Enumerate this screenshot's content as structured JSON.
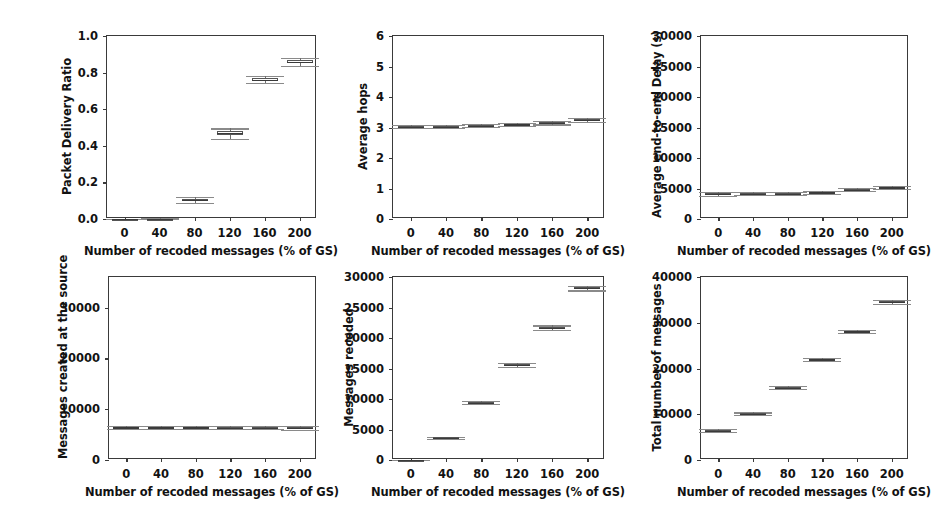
{
  "figure": {
    "background_color": "#ffffff",
    "axis_color": "#3a3a3a",
    "box_color": "#555555",
    "whisker_color": "#6e6e6e",
    "shared_xlabel": "Number of recoded messages (% of GS)",
    "shared_xticks": [
      "0",
      "40",
      "80",
      "120",
      "160",
      "200"
    ],
    "panel_count": 6
  },
  "chart_data": [
    {
      "id": "packet-delivery-ratio",
      "type": "box",
      "title": "",
      "xlabel": "Number of recoded messages (% of GS)",
      "ylabel": "Packet Delivery Ratio",
      "categories": [
        "0",
        "40",
        "80",
        "120",
        "160",
        "200"
      ],
      "x": [
        0,
        40,
        80,
        120,
        160,
        200
      ],
      "xlim": [
        -20,
        220
      ],
      "ylim": [
        0.0,
        1.0
      ],
      "yticks": [
        "0.0",
        "0.2",
        "0.4",
        "0.6",
        "0.8",
        "1.0"
      ],
      "ytick_values": [
        0.0,
        0.2,
        0.4,
        0.6,
        0.8,
        1.0
      ],
      "xticks": [
        "0",
        "40",
        "80",
        "120",
        "160",
        "200"
      ],
      "grid": false,
      "legend": "none",
      "boxes": [
        {
          "category": "0",
          "whisker_low": 0.0,
          "q1": 0.0,
          "median": 0.0,
          "q3": 0.0,
          "whisker_high": 0.0
        },
        {
          "category": "40",
          "whisker_low": 0.0,
          "q1": 0.0,
          "median": 0.0,
          "q3": 0.0,
          "whisker_high": 0.005
        },
        {
          "category": "80",
          "whisker_low": 0.088,
          "q1": 0.097,
          "median": 0.103,
          "q3": 0.11,
          "whisker_high": 0.118
        },
        {
          "category": "120",
          "whisker_low": 0.437,
          "q1": 0.461,
          "median": 0.472,
          "q3": 0.483,
          "whisker_high": 0.495
        },
        {
          "category": "160",
          "whisker_low": 0.742,
          "q1": 0.753,
          "median": 0.76,
          "q3": 0.77,
          "whisker_high": 0.782
        },
        {
          "category": "200",
          "whisker_low": 0.838,
          "q1": 0.852,
          "median": 0.86,
          "q3": 0.868,
          "whisker_high": 0.88
        }
      ]
    },
    {
      "id": "average-hops",
      "type": "box",
      "title": "",
      "xlabel": "Number of recoded messages (% of GS)",
      "ylabel": "Average hops",
      "categories": [
        "0",
        "40",
        "80",
        "120",
        "160",
        "200"
      ],
      "x": [
        0,
        40,
        80,
        120,
        160,
        200
      ],
      "xlim": [
        -20,
        220
      ],
      "ylim": [
        0,
        6
      ],
      "yticks": [
        "0",
        "1",
        "2",
        "3",
        "4",
        "5",
        "6"
      ],
      "ytick_values": [
        0,
        1,
        2,
        3,
        4,
        5,
        6
      ],
      "xticks": [
        "0",
        "40",
        "80",
        "120",
        "160",
        "200"
      ],
      "grid": false,
      "legend": "none",
      "boxes": [
        {
          "category": "0",
          "whisker_low": 2.98,
          "q1": 3.01,
          "median": 3.03,
          "q3": 3.05,
          "whisker_high": 3.08
        },
        {
          "category": "40",
          "whisker_low": 2.98,
          "q1": 3.01,
          "median": 3.03,
          "q3": 3.05,
          "whisker_high": 3.08
        },
        {
          "category": "80",
          "whisker_low": 3.01,
          "q1": 3.04,
          "median": 3.06,
          "q3": 3.08,
          "whisker_high": 3.11
        },
        {
          "category": "120",
          "whisker_low": 3.05,
          "q1": 3.08,
          "median": 3.1,
          "q3": 3.12,
          "whisker_high": 3.15
        },
        {
          "category": "160",
          "whisker_low": 3.1,
          "q1": 3.13,
          "median": 3.15,
          "q3": 3.17,
          "whisker_high": 3.2
        },
        {
          "category": "200",
          "whisker_low": 3.19,
          "q1": 3.22,
          "median": 3.25,
          "q3": 3.27,
          "whisker_high": 3.3
        }
      ]
    },
    {
      "id": "average-end-to-end-delay",
      "type": "box",
      "title": "",
      "xlabel": "Number of recoded messages (% of GS)",
      "ylabel": "Average end-to-end Delay (s)",
      "categories": [
        "0",
        "40",
        "80",
        "120",
        "160",
        "200"
      ],
      "x": [
        0,
        40,
        80,
        120,
        160,
        200
      ],
      "xlim": [
        -20,
        220
      ],
      "ylim": [
        0,
        30000
      ],
      "yticks": [
        "0",
        "5000",
        "10000",
        "15000",
        "20000",
        "25000",
        "30000"
      ],
      "ytick_values": [
        0,
        5000,
        10000,
        15000,
        20000,
        25000,
        30000
      ],
      "xticks": [
        "0",
        "40",
        "80",
        "120",
        "160",
        "200"
      ],
      "grid": false,
      "legend": "none",
      "boxes": [
        {
          "category": "0",
          "whisker_low": 3850,
          "q1": 4050,
          "median": 4150,
          "q3": 4250,
          "whisker_high": 4450
        },
        {
          "category": "40",
          "whisker_low": 3870,
          "q1": 4060,
          "median": 4160,
          "q3": 4260,
          "whisker_high": 4460
        },
        {
          "category": "80",
          "whisker_low": 3950,
          "q1": 4090,
          "median": 4180,
          "q3": 4270,
          "whisker_high": 4400
        },
        {
          "category": "120",
          "whisker_low": 4050,
          "q1": 4250,
          "median": 4350,
          "q3": 4450,
          "whisker_high": 4650
        },
        {
          "category": "160",
          "whisker_low": 4550,
          "q1": 4720,
          "median": 4820,
          "q3": 4920,
          "whisker_high": 5100
        },
        {
          "category": "200",
          "whisker_low": 4950,
          "q1": 5100,
          "median": 5200,
          "q3": 5300,
          "whisker_high": 5450
        }
      ]
    },
    {
      "id": "messages-created-at-the-source",
      "type": "box",
      "title": "",
      "xlabel": "Number of recoded messages (% of GS)",
      "ylabel": "Messages created at the source",
      "categories": [
        "0",
        "40",
        "80",
        "120",
        "160",
        "200"
      ],
      "x": [
        0,
        40,
        80,
        120,
        160,
        200
      ],
      "xlim": [
        -20,
        220
      ],
      "ylim": [
        0,
        36000
      ],
      "yticks": [
        "0",
        "10000",
        "20000",
        "30000"
      ],
      "ytick_values": [
        0,
        10000,
        20000,
        30000
      ],
      "xticks": [
        "0",
        "40",
        "80",
        "120",
        "160",
        "200"
      ],
      "grid": false,
      "legend": "none",
      "boxes": [
        {
          "category": "0",
          "whisker_low": 6100,
          "q1": 6300,
          "median": 6420,
          "q3": 6540,
          "whisker_high": 6750
        },
        {
          "category": "40",
          "whisker_low": 6100,
          "q1": 6300,
          "median": 6420,
          "q3": 6540,
          "whisker_high": 6750
        },
        {
          "category": "80",
          "whisker_low": 6080,
          "q1": 6280,
          "median": 6400,
          "q3": 6520,
          "whisker_high": 6720
        },
        {
          "category": "120",
          "whisker_low": 6050,
          "q1": 6250,
          "median": 6370,
          "q3": 6490,
          "whisker_high": 6700
        },
        {
          "category": "160",
          "whisker_low": 6020,
          "q1": 6220,
          "median": 6340,
          "q3": 6460,
          "whisker_high": 6670
        },
        {
          "category": "200",
          "whisker_low": 6000,
          "q1": 6200,
          "median": 6320,
          "q3": 6440,
          "whisker_high": 6650
        }
      ]
    },
    {
      "id": "messages-recoded",
      "type": "box",
      "title": "",
      "xlabel": "Number of recoded messages (% of GS)",
      "ylabel": "Messages recoded",
      "categories": [
        "0",
        "40",
        "80",
        "120",
        "160",
        "200"
      ],
      "x": [
        0,
        40,
        80,
        120,
        160,
        200
      ],
      "xlim": [
        -20,
        220
      ],
      "ylim": [
        0,
        30000
      ],
      "yticks": [
        "0",
        "5000",
        "10000",
        "15000",
        "20000",
        "25000",
        "30000"
      ],
      "ytick_values": [
        0,
        5000,
        10000,
        15000,
        20000,
        25000,
        30000
      ],
      "xticks": [
        "0",
        "40",
        "80",
        "120",
        "160",
        "200"
      ],
      "grid": false,
      "legend": "none",
      "boxes": [
        {
          "category": "0",
          "whisker_low": 0,
          "q1": 0,
          "median": 0,
          "q3": 0,
          "whisker_high": 0
        },
        {
          "category": "40",
          "whisker_low": 3400,
          "q1": 3550,
          "median": 3620,
          "q3": 3690,
          "whisker_high": 3850
        },
        {
          "category": "80",
          "whisker_low": 9150,
          "q1": 9300,
          "median": 9400,
          "q3": 9480,
          "whisker_high": 9620
        },
        {
          "category": "120",
          "whisker_low": 15200,
          "q1": 15450,
          "median": 15560,
          "q3": 15660,
          "whisker_high": 15900
        },
        {
          "category": "160",
          "whisker_low": 21300,
          "q1": 21580,
          "median": 21700,
          "q3": 21830,
          "whisker_high": 22050
        },
        {
          "category": "200",
          "whisker_low": 27800,
          "q1": 28050,
          "median": 28180,
          "q3": 28300,
          "whisker_high": 28550
        }
      ]
    },
    {
      "id": "total-number-of-messages",
      "type": "box",
      "title": "",
      "xlabel": "Number of recoded messages (% of GS)",
      "ylabel": "Total number of messages",
      "categories": [
        "0",
        "40",
        "80",
        "120",
        "160",
        "200"
      ],
      "x": [
        0,
        40,
        80,
        120,
        160,
        200
      ],
      "xlim": [
        -20,
        220
      ],
      "ylim": [
        0,
        40000
      ],
      "yticks": [
        "0",
        "10000",
        "20000",
        "30000",
        "40000"
      ],
      "ytick_values": [
        0,
        10000,
        20000,
        30000,
        40000
      ],
      "xticks": [
        "0",
        "40",
        "80",
        "120",
        "160",
        "200"
      ],
      "grid": false,
      "legend": "none",
      "boxes": [
        {
          "category": "0",
          "whisker_low": 6100,
          "q1": 6300,
          "median": 6420,
          "q3": 6540,
          "whisker_high": 6750
        },
        {
          "category": "40",
          "whisker_low": 9800,
          "q1": 10000,
          "median": 10100,
          "q3": 10200,
          "whisker_high": 10400
        },
        {
          "category": "80",
          "whisker_low": 15450,
          "q1": 15700,
          "median": 15820,
          "q3": 15930,
          "whisker_high": 16150
        },
        {
          "category": "120",
          "whisker_low": 21600,
          "q1": 21850,
          "median": 21970,
          "q3": 22080,
          "whisker_high": 22300
        },
        {
          "category": "160",
          "whisker_low": 27700,
          "q1": 27980,
          "median": 28120,
          "q3": 28250,
          "whisker_high": 28500
        },
        {
          "category": "200",
          "whisker_low": 34200,
          "q1": 34450,
          "median": 34600,
          "q3": 34720,
          "whisker_high": 34980
        }
      ]
    }
  ],
  "panels": [
    {
      "id": "packet-delivery-ratio",
      "frame": {
        "left": 106,
        "top": 35,
        "width": 210,
        "height": 183
      },
      "ylabel_offset": 46
    },
    {
      "id": "average-hops",
      "frame": {
        "left": 392,
        "top": 35,
        "width": 212,
        "height": 183
      },
      "ylabel_offset": 36
    },
    {
      "id": "average-end-to-end-delay",
      "frame": {
        "left": 700,
        "top": 35,
        "width": 208,
        "height": 183
      },
      "ylabel_offset": 50
    },
    {
      "id": "messages-created-at-the-source",
      "frame": {
        "left": 108,
        "top": 276,
        "width": 208,
        "height": 183
      },
      "ylabel_offset": 52
    },
    {
      "id": "messages-recoded",
      "frame": {
        "left": 392,
        "top": 276,
        "width": 212,
        "height": 183
      },
      "ylabel_offset": 50
    },
    {
      "id": "total-number-of-messages",
      "frame": {
        "left": 700,
        "top": 276,
        "width": 208,
        "height": 183
      },
      "ylabel_offset": 50
    }
  ]
}
